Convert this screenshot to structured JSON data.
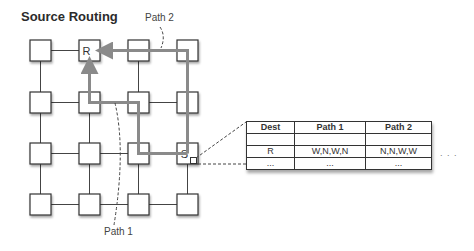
{
  "title": "Source Routing",
  "grid": {
    "rows": 4,
    "cols": 4,
    "nodes": [
      {
        "row": 0,
        "col": 1,
        "label": "R",
        "role": "receiver"
      },
      {
        "row": 2,
        "col": 3,
        "label": "S",
        "role": "sender"
      }
    ]
  },
  "paths": [
    {
      "name": "Path 1",
      "label": "Path 1",
      "hops": [
        "W",
        "N",
        "W",
        "N"
      ]
    },
    {
      "name": "Path 2",
      "label": "Path 2",
      "hops": [
        "N",
        "N",
        "W",
        "W"
      ]
    }
  ],
  "routing_table": {
    "headers": [
      "Dest",
      "Path 1",
      "Path 2"
    ],
    "rows": [
      [
        "",
        "",
        ""
      ],
      [
        "R",
        "W,N,W,N",
        "N,N,W,W"
      ],
      [
        "...",
        "...",
        "..."
      ]
    ],
    "more_indicator": ". . ."
  },
  "colors": {
    "path": "#8a8a8a",
    "link": "#444444",
    "node_border": "#333333"
  }
}
